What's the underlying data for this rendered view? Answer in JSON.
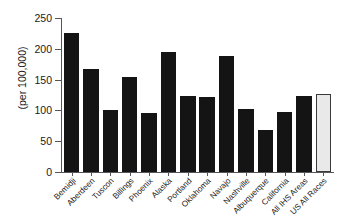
{
  "chart_data": {
    "type": "bar",
    "title": "",
    "xlabel": "",
    "ylabel": "(per 100,000)",
    "ylim": [
      0,
      250
    ],
    "yticks": [
      0,
      50,
      100,
      150,
      200,
      250
    ],
    "grid": false,
    "legend": "none",
    "categories": [
      "Bemidji",
      "Aberdeen",
      "Tuscon",
      "Billings",
      "Phoenix",
      "Alaska",
      "Portland",
      "Oklahoma",
      "Navajo",
      "Nashville",
      "Albuquerque",
      "California",
      "All IHS Areas",
      "US All Races"
    ],
    "values": [
      225,
      167,
      100,
      155,
      95,
      195,
      124,
      121,
      189,
      103,
      68,
      98,
      124,
      126
    ],
    "series": [
      {
        "name": "Rate per 100,000",
        "values": [
          225,
          167,
          100,
          155,
          95,
          195,
          124,
          121,
          189,
          103,
          68,
          98,
          124,
          126
        ]
      }
    ],
    "bar_colors": {
      "default": "#141414",
      "highlight": "#e9e9e9",
      "highlight_border": "#3a3a3a"
    },
    "highlight_categories": [
      "US All Races"
    ]
  }
}
